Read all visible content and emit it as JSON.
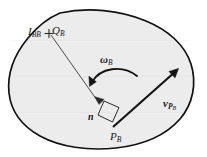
{
  "figure": {
    "caption": "",
    "canvas": {
      "width": 207,
      "height": 157
    },
    "colors": {
      "background": "#ffffff",
      "body_fill": "#ececec",
      "body_stroke": "#111111",
      "vector_stroke": "#1a1a1a",
      "thin_line_stroke": "#4a4a4a",
      "label_text": "#1a1a1a"
    },
    "body": {
      "name": "rigid-body-outline",
      "shape": "closed irregular blob / amoeba outline",
      "fill": "#ececec",
      "stroke_width": 1.6
    },
    "labels": {
      "inertia": {
        "base": "I",
        "sub": "BB"
      },
      "centroid": {
        "base": "Q",
        "sub": "B"
      },
      "angular_velocity": {
        "base": "ω",
        "sub": "B"
      },
      "normal": {
        "base": "n",
        "sub": ""
      },
      "point": {
        "base": "P",
        "sub": "B"
      },
      "velocity": {
        "base": "v",
        "sub": "P",
        "subsub": "B"
      }
    },
    "markers": {
      "centroid_marker": "plus-cross",
      "right_angle_marker": "square",
      "angular_arc_direction": "counterclockwise"
    },
    "vectors": [
      {
        "name": "normal-vector-n",
        "label": "n",
        "from": "Q_B",
        "to": "P_B",
        "style": "thin line with arrowhead"
      },
      {
        "name": "velocity-vector-vPB",
        "label": "v_PB",
        "from": "P_B",
        "to": "upper-right",
        "style": "thick line with arrowhead"
      },
      {
        "name": "angular-velocity-arc",
        "label": "omega_B",
        "style": "curved arc with arrowhead"
      }
    ]
  }
}
